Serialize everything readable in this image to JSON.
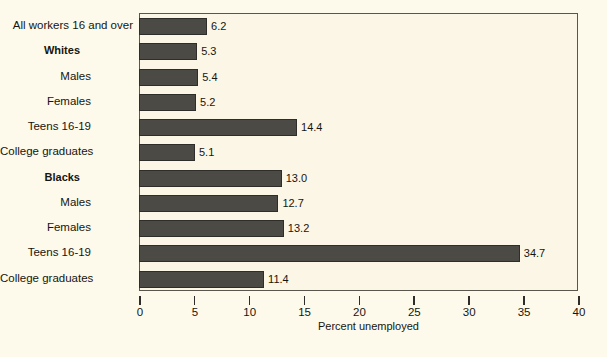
{
  "chart_data": {
    "type": "bar",
    "orientation": "horizontal",
    "title": "",
    "subtitle": "",
    "xlabel": "Percent unemployed",
    "ylabel": "",
    "xlim": [
      0,
      40
    ],
    "xticks": [
      0,
      5,
      10,
      15,
      20,
      25,
      30,
      35,
      40
    ],
    "xtick_labels": [
      "0",
      "5",
      "10",
      "15",
      "20",
      "25",
      "30",
      "35",
      "40"
    ],
    "grid": false,
    "legend": null,
    "bar_color": "#4b4a44",
    "plot_background": "#fcf6e6",
    "page_background": "#fdfaeb",
    "categories": [
      "All workers 16 and over",
      "Whites",
      "Males",
      "Females",
      "Teens 16-19",
      "College graduates",
      "Blacks",
      "Males",
      "Females",
      "Teens 16-19",
      "College graduates"
    ],
    "values": [
      6.2,
      5.3,
      5.4,
      5.2,
      14.4,
      5.1,
      13.0,
      12.7,
      13.2,
      34.7,
      11.4
    ],
    "data_labels": [
      "6.2",
      "5.3",
      "5.4",
      "5.2",
      "14.4",
      "5.1",
      "13.0",
      "12.7",
      "13.2",
      "34.7",
      "11.4"
    ],
    "rows": [
      {
        "label": "All workers 16 and over",
        "value": 6.2,
        "label_text": "6.2",
        "style": "top",
        "indent": 0
      },
      {
        "label": "Whites",
        "value": 5.3,
        "label_text": "5.3",
        "style": "bold",
        "indent": 1
      },
      {
        "label": "Males",
        "value": 5.4,
        "label_text": "5.4",
        "style": "normal",
        "indent": 2
      },
      {
        "label": "Females",
        "value": 5.2,
        "label_text": "5.2",
        "style": "normal",
        "indent": 2
      },
      {
        "label": "Teens 16-19",
        "value": 14.4,
        "label_text": "14.4",
        "style": "normal",
        "indent": 2
      },
      {
        "label": "College graduates",
        "value": 5.1,
        "label_text": "5.1",
        "style": "normal",
        "indent": 2
      },
      {
        "label": "Blacks",
        "value": 13.0,
        "label_text": "13.0",
        "style": "bold",
        "indent": 1
      },
      {
        "label": "Males",
        "value": 12.7,
        "label_text": "12.7",
        "style": "normal",
        "indent": 2
      },
      {
        "label": "Females",
        "value": 13.2,
        "label_text": "13.2",
        "style": "normal",
        "indent": 2
      },
      {
        "label": "Teens 16-19",
        "value": 34.7,
        "label_text": "34.7",
        "style": "normal",
        "indent": 2
      },
      {
        "label": "College graduates",
        "value": 11.4,
        "label_text": "11.4",
        "style": "normal",
        "indent": 2
      }
    ]
  }
}
